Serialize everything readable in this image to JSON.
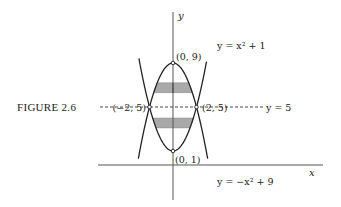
{
  "figure": {
    "caption": "FIGURE 2.6",
    "axes": {
      "x_label": "x",
      "y_label": "y"
    },
    "curves": [
      {
        "name": "upward-parabola",
        "label": "y = x² + 1",
        "a": 1,
        "c": 1
      },
      {
        "name": "downward-parabola",
        "label": "y = −x² + 9",
        "a": -1,
        "c": 9
      }
    ],
    "line": {
      "label": "y = 5",
      "y": 5
    },
    "points": [
      {
        "label": "(0, 9)",
        "x": 0,
        "y": 9
      },
      {
        "label": "(0, 1)",
        "x": 0,
        "y": 1
      },
      {
        "label": "(−2, 5)",
        "x": -2,
        "y": 5
      },
      {
        "label": "(2, 5)",
        "x": 2,
        "y": 5
      }
    ],
    "shaded_strips": [
      {
        "y_from": 6.3,
        "y_to": 7.2
      },
      {
        "y_from": 3.1,
        "y_to": 4.0
      }
    ],
    "colors": {
      "ink": "#222222",
      "shade": "#a9a9a9",
      "axis": "#555555"
    }
  }
}
